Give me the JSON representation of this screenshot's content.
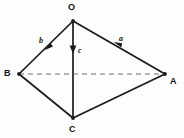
{
  "figure": {
    "background_color": "#fdfdfd",
    "line_color": "#1a1a1a",
    "dashed_color": "#6e6e6e"
  },
  "vertices": [
    {
      "id": "O",
      "label": "O",
      "x": 73,
      "y": 21,
      "label_x": 70,
      "label_y": 5
    },
    {
      "id": "B",
      "label": "B",
      "x": 19,
      "y": 74,
      "label_x": 5,
      "label_y": 70
    },
    {
      "id": "A",
      "label": "A",
      "x": 165,
      "y": 74,
      "label_x": 170,
      "label_y": 77
    },
    {
      "id": "C",
      "label": "C",
      "x": 73,
      "y": 118,
      "label_x": 70,
      "label_y": 125
    }
  ],
  "edges": [
    {
      "id": "OB",
      "from": "O",
      "to": "B",
      "style": "solid"
    },
    {
      "id": "OA",
      "from": "O",
      "to": "A",
      "style": "solid"
    },
    {
      "id": "OC",
      "from": "O",
      "to": "C",
      "style": "solid"
    },
    {
      "id": "BC",
      "from": "B",
      "to": "C",
      "style": "solid"
    },
    {
      "id": "CA",
      "from": "C",
      "to": "A",
      "style": "solid"
    },
    {
      "id": "BA",
      "from": "B",
      "to": "A",
      "style": "dashed"
    }
  ],
  "vectors": [
    {
      "id": "b",
      "label": "b",
      "from": "O",
      "to": "B",
      "arrow_x": 48,
      "arrow_y": 47,
      "label_x": 40,
      "label_y": 38
    },
    {
      "id": "a",
      "label": "a",
      "from": "O",
      "to": "A",
      "arrow_x": 118,
      "arrow_y": 45,
      "label_x": 119,
      "label_y": 36
    },
    {
      "id": "c",
      "label": "c",
      "from": "O",
      "to": "C",
      "arrow_x": 73,
      "arrow_y": 51,
      "label_x": 78,
      "label_y": 49
    }
  ]
}
